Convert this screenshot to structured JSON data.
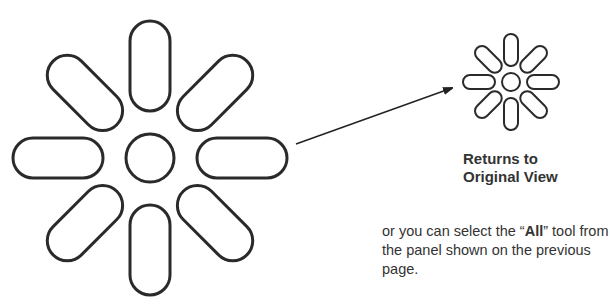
{
  "large_icon": {
    "name": "original-view-icon",
    "cx": 150,
    "cy": 158
  },
  "small_icon": {
    "name": "original-view-icon-small",
    "cx": 511,
    "cy": 82
  },
  "arrow": {
    "x1": 296,
    "y1": 144,
    "x2": 452,
    "y2": 88
  },
  "caption": {
    "line1": "Returns to",
    "line2": "Original View"
  },
  "note": {
    "line1_pre": "or you can select the “",
    "line1_bold": "All",
    "line1_post": "” tool from",
    "line2": "the panel shown on the previous page."
  },
  "colors": {
    "stroke": "#2a2a2a"
  }
}
